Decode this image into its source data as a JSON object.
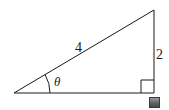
{
  "diagram": {
    "type": "right-triangle",
    "hypotenuse_label": "4",
    "opposite_label": "2",
    "angle_label": "θ",
    "right_angle_marker": true,
    "colors": {
      "stroke": "#1a1a1a",
      "background": "#ffffff",
      "marker": "#5e5e5e"
    }
  }
}
